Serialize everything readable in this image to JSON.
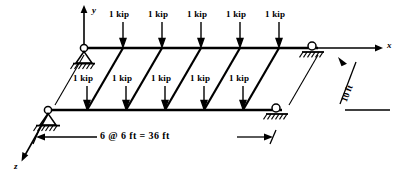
{
  "figure": {
    "stroke_color": "#000000",
    "background_color": "#ffffff"
  },
  "axes": {
    "x_label": "x",
    "y_label": "y",
    "z_label": "z"
  },
  "loads": {
    "top_beam": [
      {
        "label": "1 kip"
      },
      {
        "label": "1 kip"
      },
      {
        "label": "1 kip"
      },
      {
        "label": "1 kip"
      },
      {
        "label": "1 kip"
      }
    ],
    "bottom_beam": [
      {
        "label": "1 kip"
      },
      {
        "label": "1 kip"
      },
      {
        "label": "1 kip"
      },
      {
        "label": "1 kip"
      },
      {
        "label": "1 kip"
      }
    ]
  },
  "dimensions": {
    "span_label": "6 @ 6 ft = 36 ft",
    "depth_label": "10 ft"
  },
  "supports": {
    "top_left": "pin-support",
    "top_right": "roller-support",
    "bottom_left": "pin-support",
    "bottom_right": "roller-support"
  }
}
